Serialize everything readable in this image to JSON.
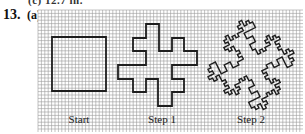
{
  "header": {
    "cutoff_text": "(c) 12.7 in.",
    "problem_number": "13.",
    "part_label": "(a)"
  },
  "figure": {
    "grid": {
      "x": 38,
      "y": 10,
      "width": 265,
      "height": 122,
      "cell": 3.4,
      "line_color": "#9a9a9a",
      "background": "#ffffff"
    },
    "curve_color": "#1e1e1e",
    "curve_width": 1.8,
    "panels": [
      {
        "id": "start",
        "label": "Start",
        "label_x": 79,
        "label_y": 123,
        "shape": "square",
        "points": [
          [
            52,
            37
          ],
          [
            106,
            37
          ],
          [
            106,
            91
          ],
          [
            52,
            91
          ]
        ]
      },
      {
        "id": "step1",
        "label": "Step 1",
        "label_x": 162,
        "label_y": 123,
        "shape": "koch-step-1",
        "points": [
          [
            146,
            24
          ],
          [
            159,
            24
          ],
          [
            159,
            51
          ],
          [
            172,
            51
          ],
          [
            172,
            38
          ],
          [
            184,
            38
          ],
          [
            184,
            51
          ],
          [
            197,
            51
          ],
          [
            197,
            65
          ],
          [
            172,
            65
          ],
          [
            172,
            79
          ],
          [
            184,
            79
          ],
          [
            184,
            92
          ],
          [
            172,
            92
          ],
          [
            172,
            106
          ],
          [
            158,
            106
          ],
          [
            158,
            79
          ],
          [
            146,
            79
          ],
          [
            146,
            92
          ],
          [
            133,
            92
          ],
          [
            133,
            79
          ],
          [
            118,
            79
          ],
          [
            118,
            65
          ],
          [
            146,
            65
          ],
          [
            146,
            51
          ],
          [
            133,
            51
          ],
          [
            133,
            38
          ],
          [
            146,
            38
          ]
        ]
      },
      {
        "id": "step2",
        "label": "Step 2",
        "label_x": 251,
        "label_y": 123,
        "shape": "koch-step-2",
        "bbox": [
          208,
          20,
          294,
          110
        ]
      }
    ],
    "generator": {
      "description": "each segment replaced by 8 unit steps",
      "steps_d_p": [
        [
          0.2,
          -0.1
        ],
        [
          0.1,
          0.2
        ],
        [
          0.1,
          0.2
        ],
        [
          0.2,
          -0.1
        ],
        [
          -0.1,
          -0.2
        ],
        [
          0.2,
          -0.1
        ],
        [
          0.1,
          0.2
        ],
        [
          0.2,
          -0.1
        ]
      ]
    }
  }
}
